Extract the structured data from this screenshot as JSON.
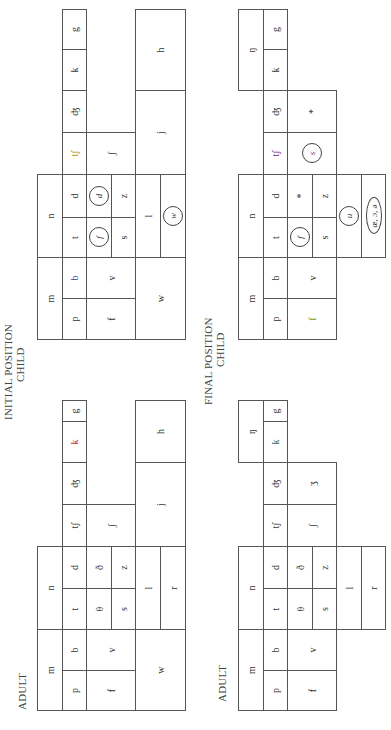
{
  "titles": {
    "initial_position": "INITIAL POSITION",
    "final_position": "FINAL POSITION",
    "adult": "ADULT",
    "child": "CHILD"
  },
  "adult_initial": {
    "m": "m",
    "n": "n",
    "p": "p",
    "b": "b",
    "t": "t",
    "d": "d",
    "tsh": "tʃ",
    "dzh": "ʤ",
    "k": "k",
    "g": "g",
    "f": "f",
    "v": "v",
    "theta": "θ",
    "eth": "ð",
    "s": "s",
    "z": "z",
    "sh": "ʃ",
    "w": "w",
    "l": "l",
    "r": "r",
    "j": "j",
    "h": "h"
  },
  "child_initial": {
    "m": "m",
    "n": "n",
    "p": "p",
    "b": "b",
    "t": "t",
    "d": "d",
    "tsh": "tʃ",
    "dzh": "ʤ",
    "k": "k",
    "g": "g",
    "f": "f",
    "v": "v",
    "theta_sub": "f",
    "eth_sub": "d",
    "s": "s",
    "z": "z",
    "sh": "ʃ",
    "w": "w",
    "l": "l",
    "r_sub": "w",
    "j": "j",
    "h": "h"
  },
  "adult_final": {
    "m": "m",
    "n": "n",
    "ng": "ŋ",
    "p": "p",
    "b": "b",
    "t": "t",
    "d": "d",
    "tsh": "tʃ",
    "dzh": "ʤ",
    "k": "k",
    "g": "g",
    "f": "f",
    "v": "v",
    "theta": "θ",
    "eth": "ð",
    "s": "s",
    "z": "z",
    "sh": "ʃ",
    "zh": "ʒ",
    "l": "l",
    "r": "r"
  },
  "child_final": {
    "m": "m",
    "n": "n",
    "ng": "ŋ",
    "p": "p",
    "b": "b",
    "t": "t",
    "d": "d",
    "tsh": "tʃ",
    "dzh": "ʤ",
    "k": "k",
    "g": "g",
    "f": "f",
    "v": "v",
    "theta_sub": "f",
    "eth_sub": "*",
    "s": "s",
    "z": "z",
    "sh_sub": "s",
    "zh_sub": "*",
    "l_sub": "u",
    "r_sub": "æ, ɔ, ə"
  },
  "accent_colors": {
    "child_tsh": "#b58a00",
    "child_final_tsh": "#6a2a8a",
    "initial_I": "#a01818",
    "adult_k": "#c03030"
  }
}
